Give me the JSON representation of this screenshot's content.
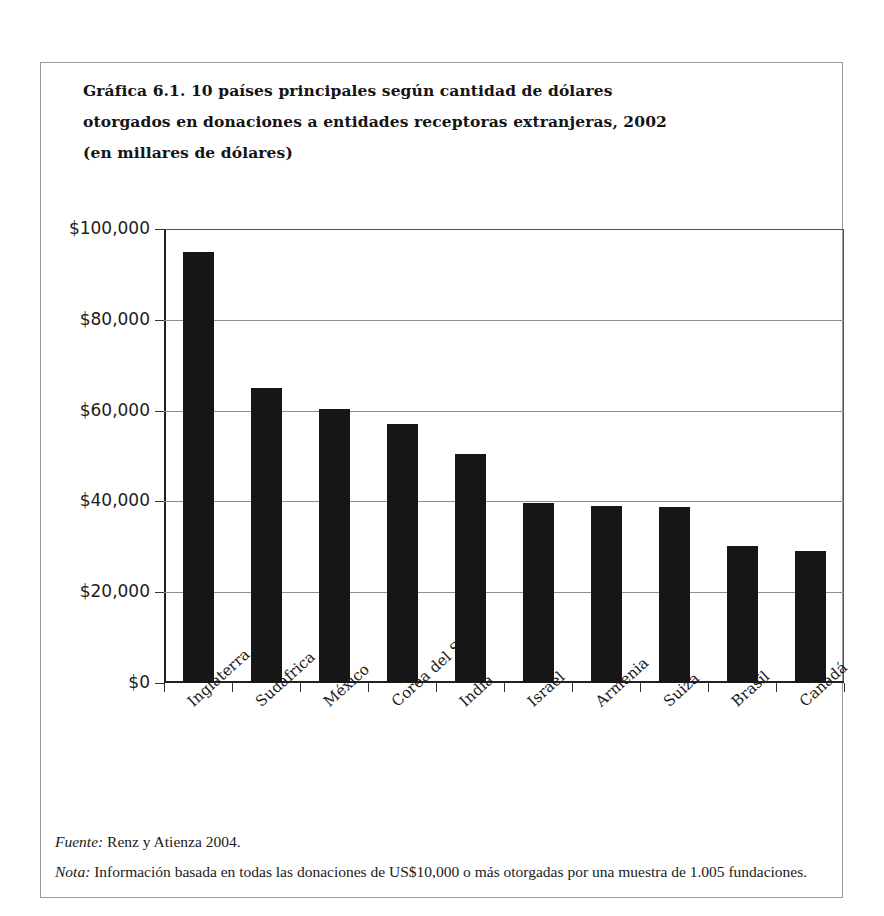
{
  "figure": {
    "title_lines": [
      "Gráfica 6.1.  10 países principales según cantidad de dólares",
      "otorgados en donaciones a  entidades receptoras extranjeras, 2002",
      "(en millares de dólares)"
    ]
  },
  "notes": {
    "source_label": "Fuente:",
    "source_text": "Renz y Atienza 2004.",
    "note_label": "Nota:",
    "note_text": "Información basada en todas las donaciones de US$10,000 o más otorgadas por una muestra de 1.005 fundaciones."
  },
  "colors": {
    "bar": "#161616",
    "axis": "#222222",
    "gridline": "#8d8d8d",
    "frame": "#9a9a9a",
    "text": "#1a1a1a"
  },
  "chart_data": {
    "type": "bar",
    "title": "Gráfica 6.1.  10 países principales según cantidad de dólares otorgados en donaciones a  entidades receptoras extranjeras, 2002 (en millares de dólares)",
    "xlabel": "",
    "ylabel": "",
    "categories": [
      "Inglaterra",
      "Sudáfrica",
      "México",
      "Corea del Sur",
      "India",
      "Israel",
      "Armenia",
      "Suiza",
      "Brasil",
      "Canadá"
    ],
    "values": [
      95000,
      65000,
      60300,
      57000,
      50500,
      39600,
      39000,
      38800,
      30200,
      29100
    ],
    "ylim": [
      0,
      100000
    ],
    "yticks": [
      0,
      20000,
      40000,
      60000,
      80000,
      100000
    ],
    "ytick_labels": [
      "$0",
      "$20,000",
      "$40,000",
      "$60,000",
      "$80,000",
      "$100,000"
    ],
    "grid": true,
    "legend": "none",
    "orientation": "vertical"
  }
}
